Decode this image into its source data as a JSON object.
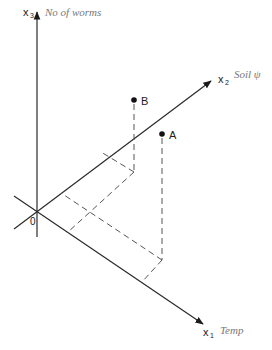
{
  "diagram": {
    "type": "3D coordinate axes with two plotted points and projection lines",
    "origin": {
      "label": "0",
      "x": 37,
      "y": 212
    },
    "axes": [
      {
        "id": "x1",
        "symbol": "x",
        "subscript": "1",
        "annotation": "Temp",
        "from": [
          14,
          196
        ],
        "to": [
          205,
          325
        ]
      },
      {
        "id": "x2",
        "symbol": "x",
        "subscript": "2",
        "annotation": "Soil ψ",
        "from": [
          14,
          229
        ],
        "to": [
          213,
          80
        ]
      },
      {
        "id": "x3",
        "symbol": "x",
        "subscript": "3",
        "annotation": "No of worms",
        "from": [
          37,
          237
        ],
        "to": [
          37,
          10
        ]
      }
    ],
    "points": [
      {
        "label": "A",
        "x": 162,
        "y": 134,
        "foot": [
          162,
          260
        ],
        "proj_x2": [
          61,
          193
        ],
        "proj_x1": [
          142,
          282
        ]
      },
      {
        "label": "B",
        "x": 134,
        "y": 100,
        "foot": [
          134,
          172
        ],
        "proj_x2": [
          101,
          152
        ],
        "proj_x1": [
          68,
          232
        ]
      }
    ]
  },
  "colors": {
    "axis": "#2a2a2a",
    "dashed": "#555555",
    "handwriting": "#777777",
    "background": "#ffffff"
  }
}
